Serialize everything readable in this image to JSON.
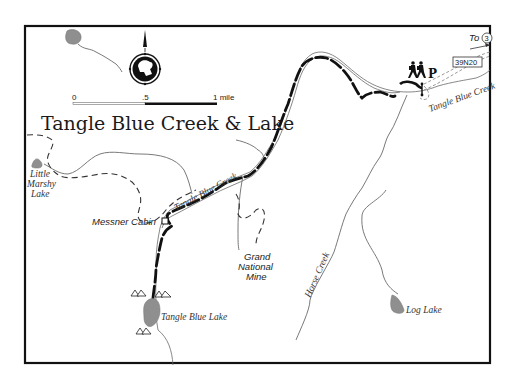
{
  "map": {
    "title": "Tangle Blue Creek & Lake",
    "scale_bar": {
      "ticks": [
        "0",
        ".5",
        "1 mile"
      ]
    },
    "compass": {
      "icon": "compass-rose-with-bighorn-sheep-icon",
      "direction": "north"
    },
    "labels": {
      "little_marshy_lake_1": "Little",
      "little_marshy_lake_2": "Marshy",
      "little_marshy_lake_3": "Lake",
      "messner_cabin": "Messner Cabin",
      "tangle_blue_creek_mid": "Tangle Blue Creek",
      "tangle_blue_creek_east": "Tangle Blue Creek",
      "grand_national_mine_1": "Grand",
      "grand_national_mine_2": "National",
      "grand_national_mine_3": "Mine",
      "horse_creek": "Horse Creek",
      "log_lake": "Log Lake",
      "tangle_blue_lake": "Tangle Blue Lake",
      "to_label": "To",
      "highway_number": "3",
      "road_number": "39N20",
      "parking": "P"
    },
    "icons": {
      "trailhead": "hikers-icon",
      "parking": "parking-icon",
      "campsite": "campsite-tent-icon",
      "cabin": "cabin-square-icon",
      "arrow": "arrow-right-icon"
    },
    "colors": {
      "frame": "#111111",
      "trail": "#111111",
      "creek": "#6a6a6a",
      "lake": "#8f8f8f",
      "road": "#999999"
    }
  }
}
